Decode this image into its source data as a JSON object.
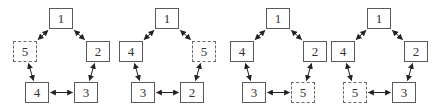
{
  "diagram": {
    "colors": {
      "line": "#222222",
      "box_border": "#5a5a5a",
      "text": "#333333"
    },
    "slots": {
      "top": {
        "x": 49,
        "y": 8
      },
      "left": {
        "x": 13,
        "y": 41
      },
      "right": {
        "x": 86,
        "y": 41
      },
      "bottom_left": {
        "x": 25,
        "y": 82
      },
      "bottom_right": {
        "x": 74,
        "y": 82
      }
    },
    "panels": [
      {
        "offset": 0,
        "nodes": {
          "top": "1",
          "left": "5",
          "right": "2",
          "bottom_left": "4",
          "bottom_right": "3"
        },
        "dashed": "left"
      },
      {
        "offset": 106,
        "nodes": {
          "top": "1",
          "left": "4",
          "right": "5",
          "bottom_left": "3",
          "bottom_right": "2"
        },
        "dashed": "right"
      },
      {
        "offset": 217,
        "nodes": {
          "top": "1",
          "left": "4",
          "right": "2",
          "bottom_left": "3",
          "bottom_right": "5"
        },
        "dashed": "bottom_right"
      },
      {
        "offset": 318,
        "nodes": {
          "top": "1",
          "left": "4",
          "right": "2",
          "bottom_left": "5",
          "bottom_right": "3"
        },
        "dashed": "bottom_left"
      }
    ],
    "edges": [
      [
        "top",
        "left"
      ],
      [
        "top",
        "right"
      ],
      [
        "left",
        "bottom_left"
      ],
      [
        "right",
        "bottom_right"
      ],
      [
        "bottom_left",
        "bottom_right"
      ]
    ]
  }
}
